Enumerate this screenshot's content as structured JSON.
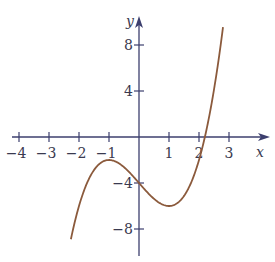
{
  "chart_data": {
    "type": "line",
    "title": "",
    "xlabel": "x",
    "ylabel": "y",
    "function": "y = x^3 - 3x - 4",
    "x_ticks": [
      -4,
      -3,
      -2,
      -1,
      1,
      2,
      3
    ],
    "x_tick_labels": [
      "−4",
      "−3",
      "−2",
      "−1",
      "1",
      "2",
      "3"
    ],
    "y_ticks": [
      8,
      4,
      -4,
      -8
    ],
    "y_tick_labels": [
      "8",
      "4",
      "−4",
      "−8"
    ],
    "xlim": [
      -4.2,
      4.3
    ],
    "ylim": [
      -10.5,
      10.5
    ],
    "grid": false,
    "series": [
      {
        "name": "curve",
        "color": "#8b5a3c",
        "x": [
          -2.27,
          -2.0,
          -1.5,
          -1.0,
          -0.5,
          0.0,
          0.5,
          1.0,
          1.5,
          2.0,
          2.2,
          2.5,
          2.8
        ],
        "y": [
          -8.9,
          -6.0,
          -2.9,
          -2.0,
          -2.6,
          -4.0,
          -5.4,
          -6.0,
          -5.1,
          -2.0,
          0.05,
          4.1,
          9.6
        ]
      }
    ],
    "key_points": {
      "local_max": [
        -1,
        -2
      ],
      "local_min": [
        1,
        -6
      ],
      "y_intercept": [
        0,
        -4
      ],
      "x_intercept_approx": 2.2
    }
  },
  "colors": {
    "axis": "#3c3f6e",
    "curve": "#8b5a3c",
    "text": "#3a3a50"
  }
}
